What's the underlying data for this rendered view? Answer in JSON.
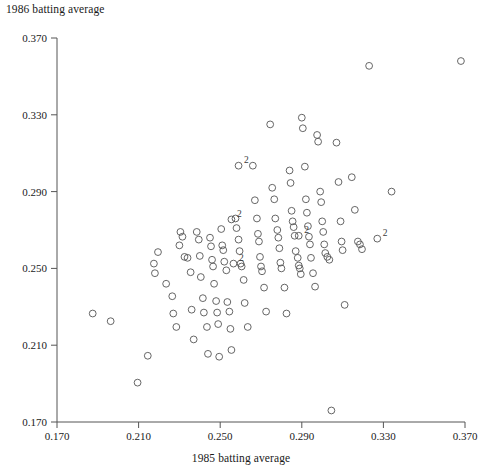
{
  "chart_data": {
    "type": "scatter",
    "title": "",
    "xlabel": "1985 batting average",
    "ylabel": "1986 batting average",
    "xlim": [
      0.17,
      0.37
    ],
    "ylim": [
      0.17,
      0.37
    ],
    "xticks": [
      "0.170",
      "0.210",
      "0.250",
      "0.290",
      "0.330",
      "0.370"
    ],
    "yticks": [
      "0.170",
      "0.210",
      "0.250",
      "0.290",
      "0.330",
      "0.370"
    ],
    "xtick_values": [
      0.17,
      0.21,
      0.25,
      0.29,
      0.33,
      0.37
    ],
    "ytick_values": [
      0.17,
      0.21,
      0.25,
      0.29,
      0.33,
      0.37
    ],
    "grid": false,
    "legend": "none",
    "marker": "open-circle",
    "marker_color": "#555555",
    "overlap_label": "2",
    "overlap_note": "A numeral 2 next to a marker denotes two coincident observations",
    "points": [
      {
        "x": 0.1875,
        "y": 0.2265
      },
      {
        "x": 0.1963,
        "y": 0.2225
      },
      {
        "x": 0.2095,
        "y": 0.1905
      },
      {
        "x": 0.2145,
        "y": 0.2045
      },
      {
        "x": 0.2175,
        "y": 0.2525
      },
      {
        "x": 0.218,
        "y": 0.2475
      },
      {
        "x": 0.2195,
        "y": 0.2585
      },
      {
        "x": 0.2235,
        "y": 0.242
      },
      {
        "x": 0.2265,
        "y": 0.2355
      },
      {
        "x": 0.227,
        "y": 0.2265
      },
      {
        "x": 0.2285,
        "y": 0.2195
      },
      {
        "x": 0.23,
        "y": 0.262
      },
      {
        "x": 0.2305,
        "y": 0.269
      },
      {
        "x": 0.2315,
        "y": 0.2665
      },
      {
        "x": 0.2325,
        "y": 0.256
      },
      {
        "x": 0.234,
        "y": 0.2555
      },
      {
        "x": 0.2355,
        "y": 0.248
      },
      {
        "x": 0.236,
        "y": 0.2285
      },
      {
        "x": 0.237,
        "y": 0.213
      },
      {
        "x": 0.2385,
        "y": 0.269
      },
      {
        "x": 0.2395,
        "y": 0.265
      },
      {
        "x": 0.24,
        "y": 0.2565
      },
      {
        "x": 0.2405,
        "y": 0.2455
      },
      {
        "x": 0.2415,
        "y": 0.2345
      },
      {
        "x": 0.242,
        "y": 0.227
      },
      {
        "x": 0.2435,
        "y": 0.2195
      },
      {
        "x": 0.244,
        "y": 0.2055
      },
      {
        "x": 0.245,
        "y": 0.266
      },
      {
        "x": 0.2455,
        "y": 0.2615
      },
      {
        "x": 0.246,
        "y": 0.2545
      },
      {
        "x": 0.2465,
        "y": 0.251
      },
      {
        "x": 0.247,
        "y": 0.242
      },
      {
        "x": 0.248,
        "y": 0.233
      },
      {
        "x": 0.2485,
        "y": 0.227
      },
      {
        "x": 0.249,
        "y": 0.221
      },
      {
        "x": 0.2495,
        "y": 0.204
      },
      {
        "x": 0.2505,
        "y": 0.2705
      },
      {
        "x": 0.251,
        "y": 0.262
      },
      {
        "x": 0.2515,
        "y": 0.2595
      },
      {
        "x": 0.252,
        "y": 0.2535
      },
      {
        "x": 0.253,
        "y": 0.249
      },
      {
        "x": 0.2535,
        "y": 0.2325
      },
      {
        "x": 0.2545,
        "y": 0.2275
      },
      {
        "x": 0.255,
        "y": 0.2185
      },
      {
        "x": 0.2555,
        "y": 0.2075
      },
      {
        "x": 0.2575,
        "y": 0.276
      },
      {
        "x": 0.258,
        "y": 0.271
      },
      {
        "x": 0.259,
        "y": 0.265
      },
      {
        "x": 0.2595,
        "y": 0.259
      },
      {
        "x": 0.26,
        "y": 0.2525
      },
      {
        "x": 0.2605,
        "y": 0.251
      },
      {
        "x": 0.2615,
        "y": 0.244
      },
      {
        "x": 0.262,
        "y": 0.232
      },
      {
        "x": 0.2635,
        "y": 0.2195
      },
      {
        "x": 0.266,
        "y": 0.3035
      },
      {
        "x": 0.267,
        "y": 0.2855
      },
      {
        "x": 0.268,
        "y": 0.276
      },
      {
        "x": 0.2685,
        "y": 0.268
      },
      {
        "x": 0.269,
        "y": 0.264
      },
      {
        "x": 0.2695,
        "y": 0.256
      },
      {
        "x": 0.27,
        "y": 0.251
      },
      {
        "x": 0.2705,
        "y": 0.2485
      },
      {
        "x": 0.2715,
        "y": 0.24
      },
      {
        "x": 0.2725,
        "y": 0.2275
      },
      {
        "x": 0.2745,
        "y": 0.325
      },
      {
        "x": 0.2755,
        "y": 0.292
      },
      {
        "x": 0.2765,
        "y": 0.286
      },
      {
        "x": 0.277,
        "y": 0.276
      },
      {
        "x": 0.278,
        "y": 0.27
      },
      {
        "x": 0.2785,
        "y": 0.266
      },
      {
        "x": 0.279,
        "y": 0.2605
      },
      {
        "x": 0.2795,
        "y": 0.253
      },
      {
        "x": 0.28,
        "y": 0.25
      },
      {
        "x": 0.2815,
        "y": 0.24
      },
      {
        "x": 0.2825,
        "y": 0.2265
      },
      {
        "x": 0.284,
        "y": 0.301
      },
      {
        "x": 0.2845,
        "y": 0.2945
      },
      {
        "x": 0.285,
        "y": 0.28
      },
      {
        "x": 0.2855,
        "y": 0.2745
      },
      {
        "x": 0.286,
        "y": 0.2715
      },
      {
        "x": 0.2865,
        "y": 0.267
      },
      {
        "x": 0.287,
        "y": 0.259
      },
      {
        "x": 0.288,
        "y": 0.2555
      },
      {
        "x": 0.2885,
        "y": 0.2515
      },
      {
        "x": 0.289,
        "y": 0.25
      },
      {
        "x": 0.2895,
        "y": 0.247
      },
      {
        "x": 0.29,
        "y": 0.3285
      },
      {
        "x": 0.2905,
        "y": 0.323
      },
      {
        "x": 0.2915,
        "y": 0.303
      },
      {
        "x": 0.292,
        "y": 0.286
      },
      {
        "x": 0.2925,
        "y": 0.279
      },
      {
        "x": 0.293,
        "y": 0.272
      },
      {
        "x": 0.2935,
        "y": 0.2665
      },
      {
        "x": 0.294,
        "y": 0.2625
      },
      {
        "x": 0.2945,
        "y": 0.2555
      },
      {
        "x": 0.2955,
        "y": 0.2475
      },
      {
        "x": 0.2965,
        "y": 0.2405
      },
      {
        "x": 0.2975,
        "y": 0.3195
      },
      {
        "x": 0.298,
        "y": 0.316
      },
      {
        "x": 0.299,
        "y": 0.29
      },
      {
        "x": 0.2995,
        "y": 0.2845
      },
      {
        "x": 0.3,
        "y": 0.2745
      },
      {
        "x": 0.3005,
        "y": 0.269
      },
      {
        "x": 0.301,
        "y": 0.2625
      },
      {
        "x": 0.3015,
        "y": 0.258
      },
      {
        "x": 0.3025,
        "y": 0.256
      },
      {
        "x": 0.3035,
        "y": 0.2545
      },
      {
        "x": 0.3045,
        "y": 0.176
      },
      {
        "x": 0.307,
        "y": 0.3155
      },
      {
        "x": 0.308,
        "y": 0.295
      },
      {
        "x": 0.309,
        "y": 0.2745
      },
      {
        "x": 0.3095,
        "y": 0.264
      },
      {
        "x": 0.31,
        "y": 0.2595
      },
      {
        "x": 0.311,
        "y": 0.231
      },
      {
        "x": 0.3145,
        "y": 0.2975
      },
      {
        "x": 0.316,
        "y": 0.2805
      },
      {
        "x": 0.3175,
        "y": 0.264
      },
      {
        "x": 0.3185,
        "y": 0.2625
      },
      {
        "x": 0.3195,
        "y": 0.26
      },
      {
        "x": 0.323,
        "y": 0.3555
      },
      {
        "x": 0.334,
        "y": 0.29
      },
      {
        "x": 0.368,
        "y": 0.358
      }
    ],
    "overlap_points": [
      {
        "x": 0.259,
        "y": 0.3035,
        "label": "2"
      },
      {
        "x": 0.2555,
        "y": 0.2755,
        "label": "2"
      },
      {
        "x": 0.2885,
        "y": 0.267,
        "label": "2"
      },
      {
        "x": 0.2565,
        "y": 0.2525,
        "label": "2"
      },
      {
        "x": 0.327,
        "y": 0.2655,
        "label": "2"
      }
    ],
    "n_markers": 124,
    "n_overlap_markers": 5
  }
}
